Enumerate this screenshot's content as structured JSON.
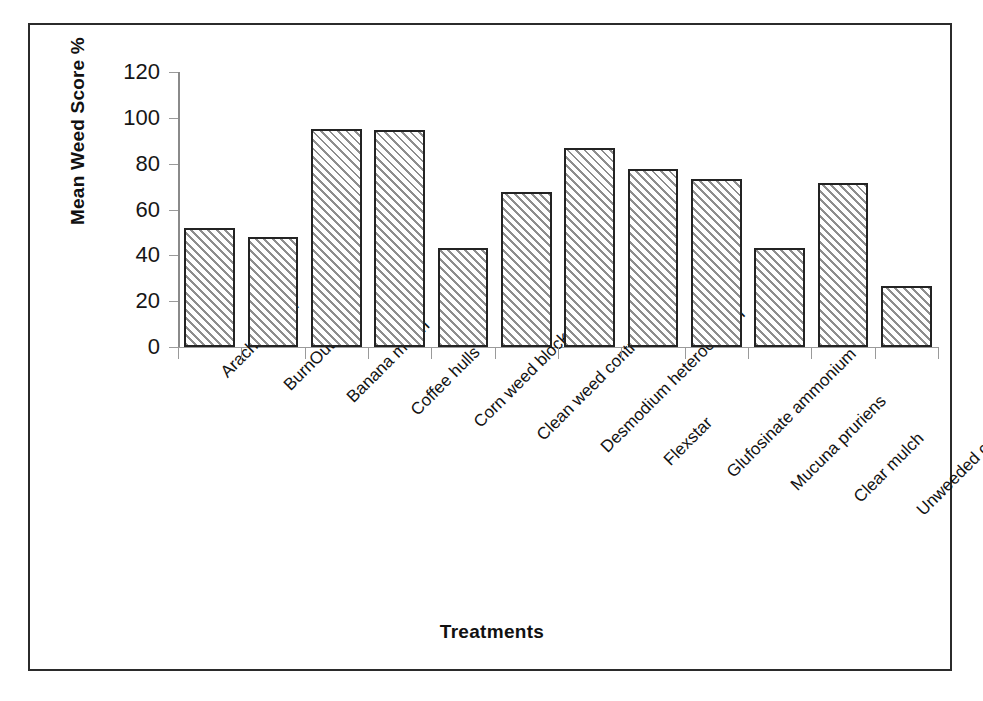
{
  "chart_data": {
    "type": "bar",
    "title": "",
    "xlabel": "Treatments",
    "ylabel": "Mean Weed Score %",
    "ylim": [
      0,
      120
    ],
    "ytick_labels": [
      "0",
      "20",
      "40",
      "60",
      "80",
      "100",
      "120"
    ],
    "yticks": [
      0,
      20,
      40,
      60,
      80,
      100,
      120
    ],
    "grid": false,
    "legend": "none",
    "categories": [
      "Arachis pintoi",
      "BurnOut",
      "Banana mulch",
      "Coffee hulls",
      "Corn weed blocker",
      "Clean weed control",
      "Desmodium heterocarpon",
      "Flexstar",
      "Glufosinate ammonium",
      "Mucuna pruriens",
      "Clear mulch",
      "Unweeded control"
    ],
    "values": [
      52,
      48,
      95,
      94.5,
      43,
      67.5,
      87,
      77.5,
      73.5,
      43,
      71.5,
      26.5
    ],
    "bar_style": {
      "fill": "diagonal-hatch",
      "hatch_color": "#8e8e8e",
      "background_color": "#ffffff",
      "edge_color": "#232323"
    }
  },
  "figure": {
    "border_color": "#2b2b2b",
    "background_color": "#ffffff",
    "axis_color": "#9a9a9a"
  }
}
